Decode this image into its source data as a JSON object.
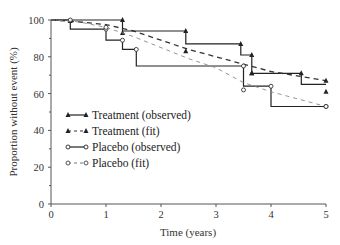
{
  "chart_data": {
    "type": "line",
    "title": "",
    "xlabel": "Time (years)",
    "ylabel": "Proportion without event (%)",
    "xlim": [
      0,
      5
    ],
    "ylim": [
      0,
      100
    ],
    "xticks": [
      0,
      1,
      2,
      3,
      4,
      5
    ],
    "yticks": [
      0,
      20,
      40,
      60,
      80,
      100
    ],
    "grid": false,
    "legend_position": "inside-left-middle",
    "series": [
      {
        "name": "Treatment (observed)",
        "style": "solid-step",
        "marker": "filled-triangle",
        "color": "#222222",
        "x": [
          0,
          1.3,
          1.3,
          2.45,
          2.45,
          3.45,
          3.45,
          3.65,
          3.65,
          4.55,
          4.55,
          5.0
        ],
        "y": [
          100,
          100,
          94,
          94,
          87,
          87,
          81,
          81,
          71,
          71,
          65,
          65
        ],
        "marker_points": [
          [
            1.3,
            100
          ],
          [
            2.45,
            94
          ],
          [
            3.45,
            87
          ],
          [
            3.65,
            81
          ],
          [
            3.65,
            71
          ],
          [
            4.55,
            71
          ],
          [
            5.0,
            61
          ]
        ]
      },
      {
        "name": "Treatment (fit)",
        "style": "dashed",
        "marker": "filled-triangle",
        "color": "#333333",
        "x": [
          0,
          0.5,
          1.0,
          1.5,
          2.0,
          2.5,
          3.0,
          3.5,
          4.0,
          4.5,
          5.0
        ],
        "y": [
          100,
          99,
          97.5,
          94,
          89,
          84,
          80,
          76,
          72,
          69.5,
          67
        ],
        "marker_points": [
          [
            0.35,
            99.5
          ],
          [
            1.3,
            93
          ],
          [
            2.45,
            83
          ],
          [
            3.65,
            71
          ],
          [
            5.0,
            67
          ]
        ]
      },
      {
        "name": "Placebo (observed)",
        "style": "solid-step",
        "marker": "open-circle",
        "color": "#222222",
        "x": [
          0,
          0.35,
          0.35,
          1.0,
          1.0,
          1.3,
          1.3,
          1.55,
          1.55,
          3.5,
          3.5,
          4.0,
          4.0,
          5.0
        ],
        "y": [
          100,
          100,
          95,
          95,
          89,
          89,
          84,
          84,
          75,
          75,
          64,
          64,
          53,
          53
        ],
        "marker_points": [
          [
            0.35,
            100
          ],
          [
            1.0,
            95
          ],
          [
            1.3,
            89
          ],
          [
            1.55,
            84
          ],
          [
            3.5,
            75
          ],
          [
            4.0,
            64
          ],
          [
            5.0,
            53
          ]
        ]
      },
      {
        "name": "Placebo (fit)",
        "style": "dashed-light",
        "marker": "open-circle",
        "color": "#888888",
        "x": [
          0,
          0.5,
          1.0,
          1.5,
          2.0,
          2.5,
          3.0,
          3.5,
          4.0,
          4.5,
          5.0
        ],
        "y": [
          100,
          99,
          96,
          91,
          85,
          79,
          74,
          66,
          61,
          57,
          53
        ],
        "marker_points": [
          [
            1.0,
            96
          ],
          [
            3.5,
            62
          ],
          [
            5.0,
            53
          ]
        ]
      }
    ]
  },
  "axes": {
    "x_title": "Time (years)",
    "y_title": "Proportion without event (%)",
    "x_ticks": [
      "0",
      "1",
      "2",
      "3",
      "4",
      "5"
    ],
    "y_ticks": [
      "0",
      "20",
      "40",
      "60",
      "80",
      "100"
    ]
  },
  "legend": {
    "items": [
      {
        "label": "Treatment (observed)"
      },
      {
        "label": "Treatment (fit)"
      },
      {
        "label": "Placebo (observed)"
      },
      {
        "label": "Placebo (fit)"
      }
    ]
  }
}
